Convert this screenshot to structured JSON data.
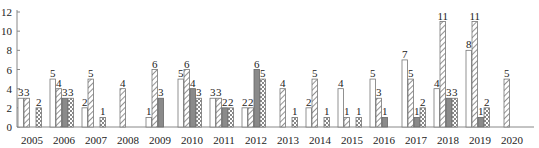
{
  "chart_data": {
    "type": "bar",
    "title": "",
    "xlabel": "",
    "ylabel": "",
    "ylim": [
      0,
      12
    ],
    "yticks": [
      0,
      2,
      4,
      6,
      8,
      10,
      12
    ],
    "grid": false,
    "legend": "none",
    "categories": [
      "2005",
      "2006",
      "2007",
      "2008",
      "2009",
      "2010",
      "2011",
      "2012",
      "2013",
      "2014",
      "2015",
      "2016",
      "2017",
      "2018",
      "2019",
      "2020"
    ],
    "series": [
      {
        "name": "Series 1 (white)",
        "pattern": "blank",
        "values": [
          3,
          5,
          2,
          null,
          1,
          5,
          3,
          2,
          null,
          2,
          4,
          5,
          7,
          4,
          8,
          null
        ]
      },
      {
        "name": "Series 2 (diagonal hatch)",
        "pattern": "hatch",
        "values": [
          3,
          4,
          5,
          4,
          6,
          6,
          3,
          2,
          4,
          5,
          1,
          3,
          5,
          11,
          11,
          5
        ]
      },
      {
        "name": "Series 3 (dark gray)",
        "pattern": "solid",
        "values": [
          null,
          3,
          null,
          null,
          3,
          4,
          2,
          6,
          null,
          null,
          null,
          1,
          1,
          3,
          1,
          null
        ]
      },
      {
        "name": "Series 4 (checkered)",
        "pattern": "check",
        "values": [
          2,
          3,
          1,
          null,
          null,
          3,
          2,
          5,
          1,
          1,
          1,
          null,
          2,
          3,
          2,
          null
        ]
      }
    ]
  }
}
